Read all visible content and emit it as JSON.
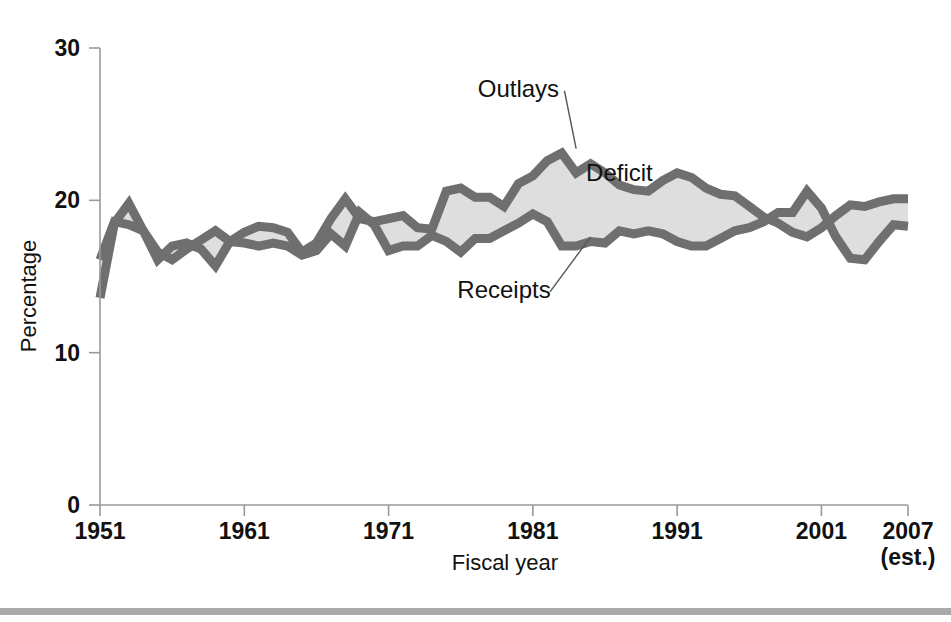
{
  "chart_data": {
    "type": "area",
    "title": "",
    "xlabel": "Fiscal year",
    "ylabel": "Percentage",
    "ylim": [
      0,
      30
    ],
    "yticks": [
      0,
      10,
      20,
      30
    ],
    "ytick_labels": [
      "0",
      "10",
      "20",
      "30"
    ],
    "xlim": [
      1951,
      2007
    ],
    "xticks": [
      1951,
      1961,
      1971,
      1981,
      1991,
      2001,
      2007
    ],
    "xtick_labels": [
      "1951",
      "1961",
      "1971",
      "1981",
      "1991",
      "2001",
      "2007"
    ],
    "xtick_sublabel_last": "(est.)",
    "grid": false,
    "legend_position": "inline-annotations",
    "annotations": [
      {
        "text": "Outlays",
        "x": 1980,
        "y": 26.8
      },
      {
        "text": "Deficit",
        "x": 1987,
        "y": 21.3
      },
      {
        "text": "Receipts",
        "x": 1979,
        "y": 13.6
      }
    ],
    "fill_color": "#dedede",
    "line_color": "#6f6f6f",
    "x": [
      1951,
      1952,
      1953,
      1954,
      1955,
      1956,
      1957,
      1958,
      1959,
      1960,
      1961,
      1962,
      1963,
      1964,
      1965,
      1966,
      1967,
      1968,
      1969,
      1970,
      1971,
      1972,
      1973,
      1974,
      1975,
      1976,
      1977,
      1978,
      1979,
      1980,
      1981,
      1982,
      1983,
      1984,
      1985,
      1986,
      1987,
      1988,
      1989,
      1990,
      1991,
      1992,
      1993,
      1994,
      1995,
      1996,
      1997,
      1998,
      1999,
      2000,
      2001,
      2002,
      2003,
      2004,
      2005,
      2006,
      2007
    ],
    "series": [
      {
        "name": "Outlays",
        "values": [
          13.6,
          18.5,
          19.8,
          18.0,
          16.6,
          16.1,
          16.8,
          17.4,
          18.0,
          17.3,
          17.9,
          18.3,
          18.2,
          17.9,
          16.6,
          17.2,
          18.8,
          20.1,
          18.8,
          18.6,
          18.8,
          19.0,
          18.2,
          18.1,
          20.6,
          20.8,
          20.2,
          20.2,
          19.6,
          21.1,
          21.6,
          22.6,
          23.1,
          21.8,
          22.4,
          21.8,
          21.0,
          20.7,
          20.6,
          21.3,
          21.8,
          21.5,
          20.8,
          20.4,
          20.3,
          19.6,
          18.9,
          18.5,
          17.9,
          17.6,
          18.2,
          19.0,
          19.7,
          19.6,
          19.9,
          20.1,
          20.1
        ]
      },
      {
        "name": "Receipts",
        "values": [
          16.1,
          18.6,
          18.4,
          18.0,
          16.1,
          17.0,
          17.2,
          16.8,
          15.7,
          17.3,
          17.2,
          17.0,
          17.2,
          17.0,
          16.4,
          16.7,
          17.8,
          17.0,
          19.2,
          18.4,
          16.7,
          17.0,
          17.0,
          17.7,
          17.3,
          16.6,
          17.5,
          17.5,
          18.0,
          18.5,
          19.1,
          18.6,
          17.0,
          17.0,
          17.3,
          17.2,
          18.0,
          17.8,
          18.0,
          17.8,
          17.3,
          17.0,
          17.0,
          17.5,
          18.0,
          18.2,
          18.6,
          19.2,
          19.2,
          20.6,
          19.5,
          17.6,
          16.2,
          16.1,
          17.3,
          18.4,
          18.3
        ]
      }
    ]
  },
  "figure": {
    "y_axis_title": "Percentage",
    "x_axis_title": "Fiscal year",
    "last_tick_sublabel": "(est.)"
  }
}
